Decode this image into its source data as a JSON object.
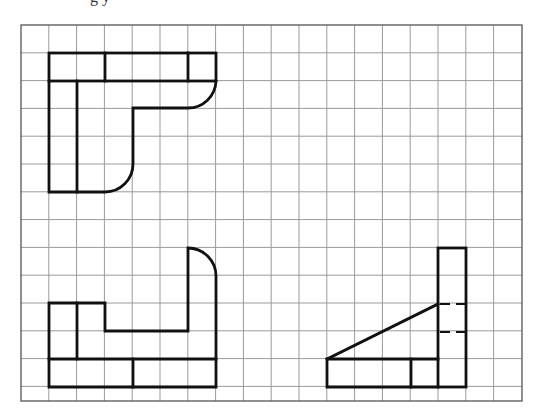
{
  "header": {
    "clipped_title": "g y"
  },
  "grid": {
    "origin_x": 21,
    "origin_y": 25,
    "cell": 27.8,
    "columns": 18,
    "full_rows": 13,
    "width": 501,
    "height": 376,
    "line_color": "#9a9a9a",
    "frame_color": "#555555"
  },
  "figures": [
    {
      "name": "top-view",
      "description": "L-shaped part with top band divided into 3 segments, rounded corners"
    },
    {
      "name": "front-view",
      "description": "U-shaped profile with rounded top-right corner"
    },
    {
      "name": "side-view",
      "description": "Vertical plate with triangular rib, hidden lines dashed"
    }
  ],
  "colors": {
    "outline": "#111111",
    "grid": "#9a9a9a",
    "background": "#ffffff"
  }
}
